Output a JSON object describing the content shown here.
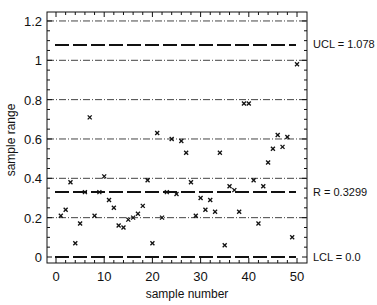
{
  "chart_data": {
    "type": "scatter",
    "title": "",
    "xlabel": "sample number",
    "ylabel": "sample range",
    "xlim": [
      -2,
      52
    ],
    "ylim": [
      -0.03,
      1.25
    ],
    "x_ticks": [
      0,
      10,
      20,
      30,
      40,
      50
    ],
    "x_tick_labels": [
      "0",
      "10",
      "20",
      "30",
      "40",
      "50"
    ],
    "y_ticks": [
      0,
      0.2,
      0.4,
      0.6,
      0.8,
      1,
      1.2
    ],
    "y_tick_labels": [
      "0",
      "0.2",
      "0.4",
      "0.6",
      "0.8",
      "1",
      "1.2"
    ],
    "grid": true,
    "marker": "x",
    "x": [
      1,
      2,
      3,
      4,
      5,
      6,
      7,
      8,
      9,
      10,
      11,
      12,
      13,
      14,
      15,
      16,
      17,
      18,
      19,
      20,
      21,
      22,
      23,
      24,
      25,
      26,
      27,
      28,
      29,
      30,
      31,
      32,
      33,
      34,
      35,
      36,
      37,
      38,
      39,
      40,
      41,
      42,
      43,
      44,
      45,
      46,
      47,
      48,
      49,
      50
    ],
    "values": [
      0.21,
      0.24,
      0.38,
      0.07,
      0.17,
      0.33,
      0.71,
      0.21,
      0.33,
      0.41,
      0.29,
      0.25,
      0.16,
      0.15,
      0.19,
      0.2,
      0.22,
      0.26,
      0.39,
      0.07,
      0.63,
      0.2,
      0.33,
      0.6,
      0.32,
      0.59,
      0.53,
      0.38,
      0.21,
      0.3,
      0.24,
      0.29,
      0.23,
      0.53,
      0.06,
      0.36,
      0.34,
      0.23,
      0.78,
      0.78,
      0.39,
      0.17,
      0.36,
      0.48,
      0.55,
      0.62,
      0.56,
      0.61,
      0.1,
      0.98
    ],
    "control_lines": [
      {
        "name": "UCL",
        "value": 1.078,
        "label": "UCL = 1.078"
      },
      {
        "name": "R",
        "value": 0.3299,
        "label": "R = 0.3299"
      },
      {
        "name": "LCL",
        "value": 0.0,
        "label": "LCL = 0.0"
      }
    ],
    "annotations": [
      "UCL = 1.078",
      "R = 0.3299",
      "LCL = 0.0"
    ]
  },
  "labels": {
    "xlabel": "sample number",
    "ylabel": "sample range",
    "ucl": "UCL = 1.078",
    "center": "R = 0.3299",
    "lcl": "LCL = 0.0"
  }
}
